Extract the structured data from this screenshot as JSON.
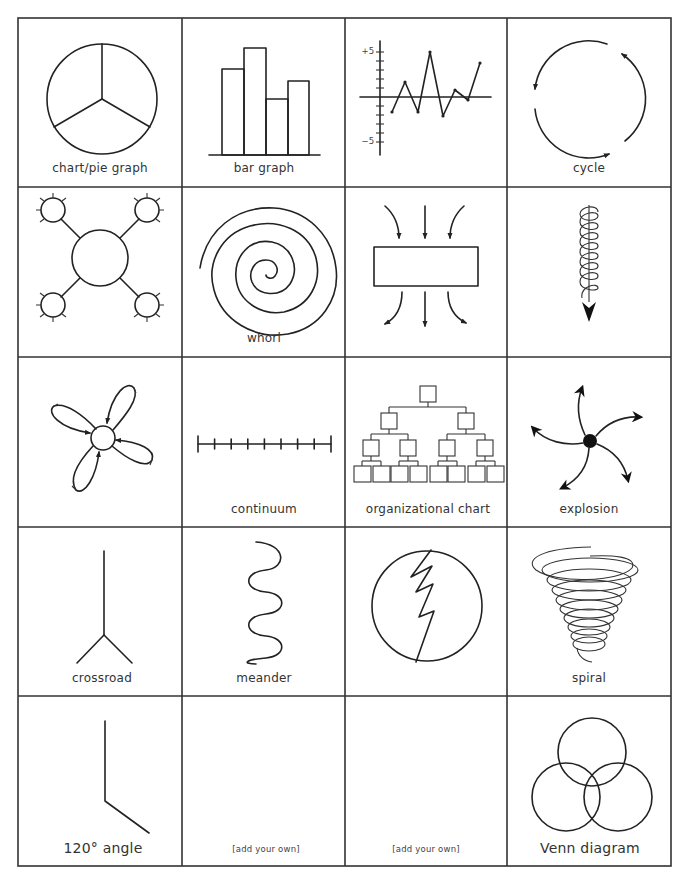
{
  "page": {
    "grid": {
      "columns": 4,
      "rows": 5,
      "col_lines": [
        18,
        182,
        345,
        507,
        671
      ],
      "row_lines": [
        18,
        187,
        357,
        527,
        696,
        866
      ]
    },
    "colors": {
      "line": "#222222",
      "label": "#333333",
      "background": "#ffffff"
    }
  },
  "cells": [
    {
      "id": "pie",
      "label": "chart/pie graph",
      "icon": "pie-chart-icon"
    },
    {
      "id": "bar",
      "label": "bar graph",
      "icon": "bar-graph-icon"
    },
    {
      "id": "line",
      "label": "",
      "icon": "line-graph-icon",
      "axis": {
        "top_label": "+5",
        "bottom_label": "−5"
      },
      "points": [
        -1.7,
        1.7,
        -1.7,
        5,
        -2,
        0.8,
        -0.3,
        3.8
      ]
    },
    {
      "id": "cycle",
      "label": "cycle",
      "icon": "cycle-arrows-icon"
    },
    {
      "id": "web",
      "label": "",
      "icon": "web-hub-icon"
    },
    {
      "id": "whorl",
      "label": "whorl",
      "icon": "whorl-spiral-icon"
    },
    {
      "id": "funnel",
      "label": "",
      "icon": "focus-flow-icon"
    },
    {
      "id": "coil",
      "label": "",
      "icon": "downward-coil-icon"
    },
    {
      "id": "petals",
      "label": "",
      "icon": "petal-loops-icon"
    },
    {
      "id": "continuum",
      "label": "continuum",
      "icon": "continuum-line-icon",
      "ticks": 9
    },
    {
      "id": "orgchart",
      "label": "organizational chart",
      "icon": "org-chart-icon"
    },
    {
      "id": "explosion",
      "label": "explosion",
      "icon": "explosion-icon"
    },
    {
      "id": "crossroad",
      "label": "crossroad",
      "icon": "crossroad-icon"
    },
    {
      "id": "meander",
      "label": "meander",
      "icon": "meander-icon"
    },
    {
      "id": "split",
      "label": "",
      "icon": "zigzag-circle-icon"
    },
    {
      "id": "spiral",
      "label": "spiral",
      "icon": "spiral-funnel-icon"
    },
    {
      "id": "angle",
      "label": "120° angle",
      "icon": "angle-icon"
    },
    {
      "id": "blank1",
      "label": "[add your own]",
      "icon": ""
    },
    {
      "id": "blank2",
      "label": "[add your own]",
      "icon": ""
    },
    {
      "id": "venn",
      "label": "Venn diagram",
      "icon": "venn-diagram-icon"
    }
  ]
}
